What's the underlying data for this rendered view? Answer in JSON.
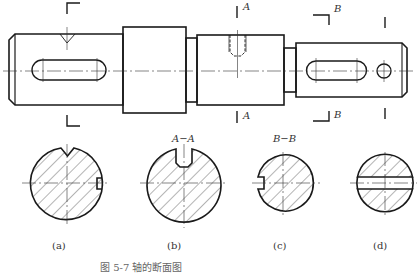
{
  "colors": {
    "outline": "#1a1a1a",
    "thin": "#333333",
    "hatch": "#444444",
    "background": "#ffffff"
  },
  "main_view": {
    "name": "shaft-front-view",
    "section_marks": [
      {
        "id": "a-plane",
        "letter": ""
      },
      {
        "id": "A",
        "letter": "A"
      },
      {
        "id": "B",
        "letter": "B"
      },
      {
        "id": "d-plane",
        "letter": ""
      }
    ],
    "labels": {
      "A_top": "A",
      "A_bottom": "A",
      "B_top": "B",
      "B_bottom": "B"
    }
  },
  "sections": [
    {
      "id": "a",
      "title": "",
      "caption": "(a)"
    },
    {
      "id": "b",
      "title": "A−A",
      "caption": "(b)"
    },
    {
      "id": "c",
      "title": "B−B",
      "caption": "(c)"
    },
    {
      "id": "d",
      "title": "",
      "caption": "(d)"
    }
  ],
  "figure_caption": "图 5-7  轴的断面图"
}
